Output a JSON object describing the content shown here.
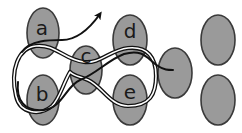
{
  "diagram": {
    "type": "node-path-diagram",
    "colors": {
      "node_fill": "#9a9a9a",
      "node_stroke": "#3a3a3a",
      "path_stroke": "#111111",
      "background": "#ffffff"
    },
    "nodes": [
      {
        "id": "a",
        "label": "a",
        "cx": 43,
        "cy": 33
      },
      {
        "id": "b",
        "label": "b",
        "cx": 43,
        "cy": 100
      },
      {
        "id": "c",
        "label": "c",
        "cx": 86,
        "cy": 70
      },
      {
        "id": "d",
        "label": "d",
        "cx": 130,
        "cy": 40
      },
      {
        "id": "e",
        "label": "e",
        "cx": 130,
        "cy": 100
      },
      {
        "id": "f",
        "label": "",
        "cx": 175,
        "cy": 73
      },
      {
        "id": "g",
        "label": "",
        "cx": 218,
        "cy": 40
      },
      {
        "id": "h",
        "label": "",
        "cx": 218,
        "cy": 100
      }
    ],
    "paths": [
      {
        "name": "double-loop-path",
        "description": "double-stroke loop through a, b, c, d, e"
      },
      {
        "name": "arrow-path",
        "description": "curve from b region through c, d ending at f; plus arrow exiting upward from a"
      }
    ]
  }
}
